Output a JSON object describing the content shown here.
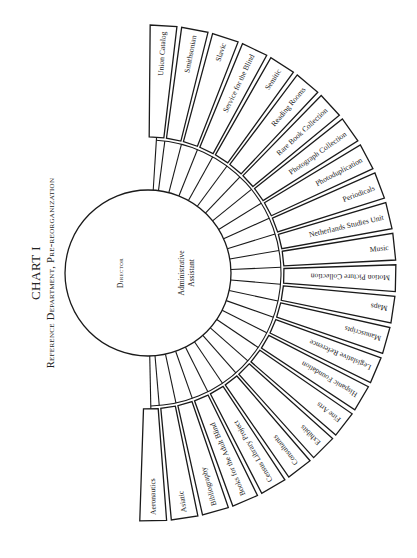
{
  "header": {
    "title": "CHART I",
    "subtitle": "Reference Department, Pre-reorganization"
  },
  "center": {
    "director_label": "Director",
    "assistant_line1": "Administrative",
    "assistant_line2": "Assistant"
  },
  "divisions": [
    "Union Catalog",
    "Smithsonian",
    "Slavic",
    "Service for the Blind",
    "Semitic",
    "Reading Rooms",
    "Rare Book Collection",
    "Photograph Collection",
    "Photoduplication",
    "Periodicals",
    "Netherlands Studies Unit",
    "Music",
    "Motion Picture Collection",
    "Maps",
    "Manuscripts",
    "Legislative Reference",
    "Hispanic Foundation",
    "Fine Arts",
    "Exhibits",
    "Consultants",
    "Census Library Project",
    "Books for the Adult Blind",
    "Bibliography",
    "Asiatic",
    "Aeronautics"
  ],
  "colors": {
    "stroke": "#1a1a1a",
    "background": "#ffffff"
  }
}
